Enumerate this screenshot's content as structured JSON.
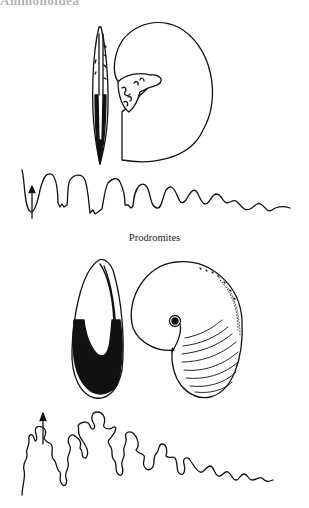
{
  "page": {
    "heading": "Ammonoidea",
    "figures": [
      {
        "name": "Goniatitid ammonoid",
        "parts": [
          "apertural view",
          "lateral view",
          "suture line"
        ]
      },
      {
        "name": "Prodromites",
        "caption": "Prodromites",
        "parts": [
          "apertural view",
          "lateral view",
          "suture line"
        ]
      }
    ]
  },
  "colors": {
    "ink": "#111111",
    "background": "#ffffff"
  }
}
